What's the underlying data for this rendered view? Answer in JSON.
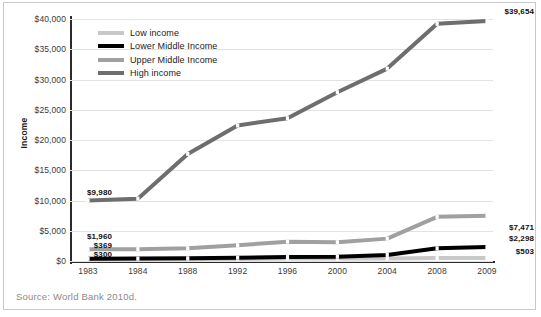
{
  "figure": {
    "source_note": "Source: World Bank 2010d.",
    "colors": {
      "low_income": "#c8c8c8",
      "lower_middle_income": "#000000",
      "upper_middle_income": "#a0a0a0",
      "high_income": "#6e6e6e",
      "gridline": "#e2e2e2",
      "axis": "#2b2b2b",
      "source_text": "#8a8a8a"
    }
  },
  "legend": {
    "position": "top-left-inside",
    "entries": [
      {
        "label": "Low income",
        "color": "#c8c8c8"
      },
      {
        "label": "Lower Middle Income",
        "color": "#000000"
      },
      {
        "label": "Upper Middle Income",
        "color": "#a0a0a0"
      },
      {
        "label": "High income",
        "color": "#6e6e6e"
      }
    ]
  },
  "axes": {
    "ylabel": "Income",
    "yticks": [
      "$0",
      "$5,000",
      "$10,000",
      "$15,000",
      "$20,000",
      "$25,000",
      "$30,000",
      "$35,000",
      "$40,000"
    ],
    "xticks": [
      "1983",
      "1984",
      "1988",
      "1992",
      "1996",
      "2000",
      "2004",
      "2008",
      "2009"
    ]
  },
  "data_labels": {
    "left": [
      {
        "text": "$9,980",
        "series": "High income"
      },
      {
        "text": "$1,960",
        "series": "Upper Middle Income"
      },
      {
        "text": "$369",
        "series": "Lower Middle Income"
      },
      {
        "text": "$300",
        "series": "Low income"
      }
    ],
    "right": [
      {
        "text": "$39,654",
        "series": "High income"
      },
      {
        "text": "$7,471",
        "series": "Upper Middle Income"
      },
      {
        "text": "$2,298",
        "series": "Lower Middle Income"
      },
      {
        "text": "$503",
        "series": "Low income"
      }
    ]
  },
  "chart_data": {
    "type": "line",
    "title": "",
    "subtitle": "",
    "xlabel": "",
    "ylabel": "Income",
    "categories": [
      "1983",
      "1984",
      "1988",
      "1992",
      "1996",
      "2000",
      "2004",
      "2008",
      "2009"
    ],
    "ylim": [
      0,
      40000
    ],
    "ytick_values": [
      0,
      5000,
      10000,
      15000,
      20000,
      25000,
      30000,
      35000,
      40000
    ],
    "grid": true,
    "legend_position": "top-left-inside",
    "series": [
      {
        "name": "Low income",
        "color": "#c8c8c8",
        "values": [
          300,
          300,
          320,
          350,
          400,
          400,
          420,
          480,
          503
        ],
        "endpoint_labels": {
          "first": "$300",
          "last": "$503"
        }
      },
      {
        "name": "Lower Middle Income",
        "color": "#000000",
        "values": [
          369,
          400,
          450,
          550,
          650,
          700,
          1000,
          2100,
          2298
        ],
        "endpoint_labels": {
          "first": "$369",
          "last": "$2,298"
        }
      },
      {
        "name": "Upper Middle Income",
        "color": "#a0a0a0",
        "values": [
          1960,
          1960,
          2100,
          2600,
          3200,
          3100,
          3700,
          7300,
          7471
        ],
        "endpoint_labels": {
          "first": "$1,960",
          "last": "$7,471"
        }
      },
      {
        "name": "High income",
        "color": "#6e6e6e",
        "values": [
          9980,
          10300,
          17700,
          22400,
          23600,
          27900,
          31800,
          39200,
          39654
        ],
        "endpoint_labels": {
          "first": "$9,980",
          "last": "$39,654"
        }
      }
    ]
  }
}
